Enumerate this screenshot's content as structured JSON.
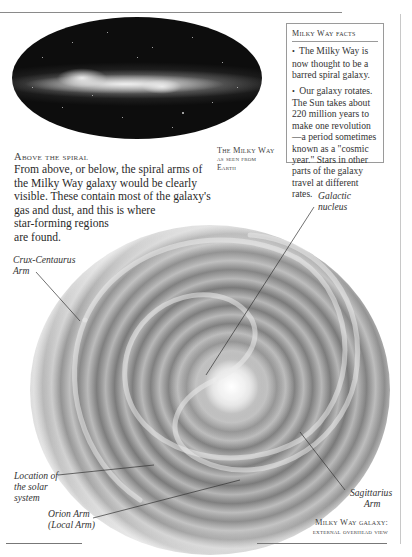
{
  "facts_box": {
    "title": "Milky Way facts",
    "items": [
      "The Milky Way is now thought to be a barred spiral galaxy.",
      "Our galaxy rotates. The Sun takes about 220 million years to make one revolution—a period sometimes known as a \"cosmic year.\" Stars in other parts of the galaxy travel at different rates."
    ],
    "bullet": "•"
  },
  "earth_image": {
    "caption_line1": "The Milky Way",
    "caption_line2": "as seen from",
    "caption_line3": "Earth"
  },
  "spiral_section": {
    "heading": "Above the spiral",
    "lines": [
      "From above, or below, the spiral arms of",
      "the Milky Way galaxy would be clearly",
      "visible. These contain most of the galaxy's",
      "gas and dust, and this is where",
      "star-forming regions",
      "are found."
    ]
  },
  "galaxy_diagram": {
    "labels": {
      "crux": [
        "Crux-Centaurus",
        "Arm"
      ],
      "nucleus": [
        "Galactic",
        "nucleus"
      ],
      "location": [
        "Location of",
        "the solar",
        "system"
      ],
      "orion": [
        "Orion Arm",
        "(Local Arm)"
      ],
      "sagittarius": [
        "Sagittarius",
        "Arm"
      ]
    },
    "caption_line1": "Milky Way galaxy:",
    "caption_line2": "external overhead view"
  },
  "colors": {
    "text": "#2a2a2a",
    "rule": "#8a8a8a",
    "space": "#0d0d0d"
  }
}
